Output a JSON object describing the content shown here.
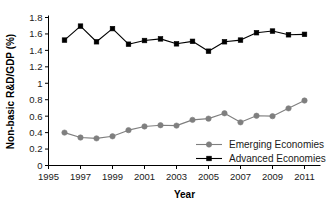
{
  "chart_data": {
    "type": "line",
    "title": "",
    "xlabel": "Year",
    "ylabel": "Non-basic R&D/GDP (%)",
    "x": [
      1996,
      1997,
      1998,
      1999,
      2000,
      2001,
      2002,
      2003,
      2004,
      2005,
      2006,
      2007,
      2008,
      2009,
      2010,
      2011
    ],
    "xlim": [
      1995,
      2012
    ],
    "ylim": [
      0,
      1.8
    ],
    "xticks": [
      1995,
      1997,
      1999,
      2001,
      2003,
      2005,
      2007,
      2009,
      2011
    ],
    "xtick_labels": [
      "1995",
      "1997",
      "1999",
      "2001",
      "2003",
      "2005",
      "2007",
      "2009",
      "2011"
    ],
    "yticks": [
      0,
      0.2,
      0.4,
      0.6,
      0.8,
      1,
      1.2,
      1.4,
      1.6,
      1.8
    ],
    "ytick_labels": [
      "0",
      "0.2",
      "0.4",
      "0.6",
      "0.8",
      "1",
      "1.2",
      "1.4",
      "1.6",
      "1.8"
    ],
    "grid": false,
    "legend_position": "inside-lower-right",
    "series": [
      {
        "name": "Emerging Economies",
        "marker": "circle",
        "color": "#7f7f7f",
        "values": [
          0.4,
          0.34,
          0.33,
          0.355,
          0.43,
          0.475,
          0.49,
          0.485,
          0.555,
          0.57,
          0.635,
          0.525,
          0.605,
          0.6,
          0.695,
          0.79
        ]
      },
      {
        "name": "Advanced Economies",
        "marker": "square",
        "color": "#000000",
        "values": [
          1.525,
          1.695,
          1.505,
          1.665,
          1.475,
          1.52,
          1.54,
          1.48,
          1.51,
          1.39,
          1.505,
          1.525,
          1.615,
          1.635,
          1.59,
          1.595
        ]
      }
    ]
  },
  "legend": {
    "items": [
      {
        "label": "Emerging Economies"
      },
      {
        "label": "Advanced Economies"
      }
    ]
  }
}
